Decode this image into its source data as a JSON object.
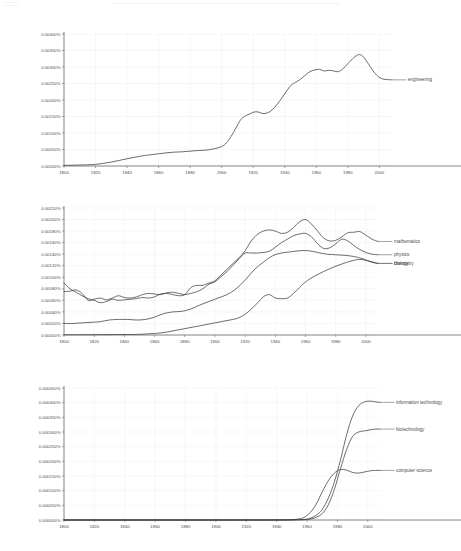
{
  "page": {
    "background_color": "#ffffff",
    "line_color": "#3b3b3b",
    "grid_color": "#e9eef2",
    "axis_color": "#6b6b6b",
    "text_color": "#4a4a4a"
  },
  "chart_data": [
    {
      "id": "chart-engineering",
      "type": "line",
      "title": "",
      "xlabel": "",
      "ylabel": "",
      "grid": true,
      "legend_position": "right-inline",
      "xlim": [
        1800,
        2008
      ],
      "ylim": [
        0,
        0.004
      ],
      "xticks": [
        1800,
        1820,
        1840,
        1860,
        1880,
        1900,
        1920,
        1940,
        1960,
        1980,
        2000
      ],
      "yticks": [
        0,
        0.0005,
        0.001,
        0.0015,
        0.002,
        0.0025,
        0.003,
        0.0035,
        0.004
      ],
      "ytick_labels": [
        "0.00000%",
        "0.00050%",
        "0.00100%",
        "0.00150%",
        "0.00200%",
        "0.00250%",
        "0.00300%",
        "0.00350%",
        "0.00400%"
      ],
      "xtick_labels": [
        "1800",
        "1820",
        "1840",
        "1860",
        "1880",
        "1900",
        "1920",
        "1940",
        "1960",
        "1980",
        "2000"
      ],
      "series": [
        {
          "name": "engineering",
          "label": "engineering",
          "color": "#3b3b3b",
          "x": [
            1800,
            1810,
            1820,
            1830,
            1840,
            1850,
            1855,
            1860,
            1865,
            1870,
            1875,
            1880,
            1885,
            1890,
            1895,
            1900,
            1903,
            1906,
            1909,
            1912,
            1915,
            1918,
            1920,
            1923,
            1926,
            1929,
            1932,
            1935,
            1938,
            1941,
            1944,
            1947,
            1950,
            1953,
            1956,
            1959,
            1962,
            1965,
            1968,
            1971,
            1974,
            1977,
            1980,
            1983,
            1986,
            1988,
            1990,
            1993,
            1996,
            1999,
            2002,
            2005,
            2008
          ],
          "values": [
            2e-05,
            3e-05,
            5e-05,
            0.00012,
            0.00022,
            0.00031,
            0.00034,
            0.00037,
            0.0004,
            0.00042,
            0.00043,
            0.00045,
            0.00047,
            0.00048,
            0.00052,
            0.00059,
            0.0007,
            0.0009,
            0.00115,
            0.0014,
            0.00152,
            0.00158,
            0.00163,
            0.00164,
            0.00159,
            0.00161,
            0.0017,
            0.00186,
            0.00205,
            0.00226,
            0.00245,
            0.00254,
            0.00263,
            0.00275,
            0.00286,
            0.00291,
            0.00293,
            0.00288,
            0.0029,
            0.00288,
            0.00286,
            0.00295,
            0.0031,
            0.00325,
            0.00336,
            0.00337,
            0.0033,
            0.0031,
            0.00288,
            0.00272,
            0.00264,
            0.00262,
            0.00261
          ]
        }
      ]
    },
    {
      "id": "chart-sciences",
      "type": "line",
      "title": "",
      "xlabel": "",
      "ylabel": "",
      "grid": true,
      "legend_position": "right-inline",
      "xlim": [
        1800,
        2008
      ],
      "ylim": [
        0,
        0.0022
      ],
      "xticks": [
        1800,
        1820,
        1840,
        1860,
        1880,
        1900,
        1920,
        1940,
        1960,
        1980,
        2000
      ],
      "yticks": [
        0,
        0.0002,
        0.0004,
        0.0006,
        0.0008,
        0.001,
        0.0012,
        0.0014,
        0.0016,
        0.0018,
        0.002,
        0.0022
      ],
      "ytick_labels": [
        "0.00000%",
        "0.00020%",
        "0.00040%",
        "0.00060%",
        "0.00080%",
        "0.00100%",
        "0.00120%",
        "0.00140%",
        "0.00160%",
        "0.00180%",
        "0.00200%",
        "0.00220%"
      ],
      "xtick_labels": [
        "1800",
        "1820",
        "1840",
        "1860",
        "1880",
        "1900",
        "1920",
        "1940",
        "1960",
        "1980",
        "2000"
      ],
      "series": [
        {
          "name": "mathematics",
          "label": "mathematics",
          "color": "#3b3b3b",
          "x": [
            1800,
            1804,
            1808,
            1812,
            1816,
            1820,
            1824,
            1828,
            1832,
            1836,
            1840,
            1844,
            1848,
            1852,
            1856,
            1860,
            1864,
            1868,
            1872,
            1876,
            1880,
            1884,
            1888,
            1892,
            1896,
            1900,
            1904,
            1908,
            1912,
            1916,
            1920,
            1924,
            1928,
            1932,
            1936,
            1940,
            1944,
            1948,
            1952,
            1956,
            1960,
            1964,
            1968,
            1972,
            1976,
            1980,
            1984,
            1988,
            1992,
            1996,
            2000,
            2004,
            2008
          ],
          "values": [
            0.0009,
            0.0008,
            0.00074,
            0.00068,
            0.00063,
            0.0006,
            0.00056,
            0.00058,
            0.00062,
            0.0006,
            0.00061,
            0.00062,
            0.00063,
            0.00065,
            0.00064,
            0.00066,
            0.00071,
            0.00072,
            0.0007,
            0.00068,
            0.0007,
            0.00082,
            0.00086,
            0.00086,
            0.0009,
            0.00094,
            0.00104,
            0.00114,
            0.00124,
            0.00134,
            0.00146,
            0.00163,
            0.00174,
            0.0018,
            0.00182,
            0.0018,
            0.00176,
            0.00178,
            0.00186,
            0.00196,
            0.002,
            0.00192,
            0.0018,
            0.00168,
            0.00163,
            0.00164,
            0.0017,
            0.00177,
            0.00178,
            0.00179,
            0.00173,
            0.00166,
            0.00162
          ]
        },
        {
          "name": "physics",
          "label": "physics",
          "color": "#3b3b3b",
          "x": [
            1800,
            1804,
            1808,
            1812,
            1816,
            1820,
            1824,
            1828,
            1832,
            1836,
            1840,
            1844,
            1848,
            1852,
            1856,
            1860,
            1864,
            1868,
            1872,
            1876,
            1880,
            1884,
            1888,
            1892,
            1896,
            1900,
            1904,
            1908,
            1912,
            1916,
            1920,
            1924,
            1928,
            1932,
            1936,
            1940,
            1944,
            1948,
            1952,
            1956,
            1960,
            1964,
            1968,
            1972,
            1976,
            1980,
            1984,
            1988,
            1992,
            1996,
            2000,
            2004,
            2008
          ],
          "values": [
            0.00075,
            0.00076,
            0.00078,
            0.00072,
            0.0006,
            0.00062,
            0.00064,
            0.00061,
            0.00064,
            0.00068,
            0.00065,
            0.00064,
            0.00066,
            0.0007,
            0.00072,
            0.00071,
            0.0007,
            0.00073,
            0.00074,
            0.00072,
            0.0007,
            0.00072,
            0.00075,
            0.0008,
            0.00088,
            0.00092,
            0.00101,
            0.0011,
            0.00121,
            0.00132,
            0.00142,
            0.00142,
            0.00142,
            0.00143,
            0.00145,
            0.00152,
            0.0016,
            0.00166,
            0.00172,
            0.00175,
            0.00176,
            0.0017,
            0.00158,
            0.0015,
            0.00151,
            0.00158,
            0.00166,
            0.00163,
            0.00155,
            0.00148,
            0.00143,
            0.0014,
            0.00139
          ]
        },
        {
          "name": "chemistry",
          "label": "chemistry",
          "color": "#3b3b3b",
          "x": [
            1800,
            1806,
            1812,
            1818,
            1824,
            1830,
            1836,
            1842,
            1848,
            1854,
            1860,
            1866,
            1872,
            1878,
            1884,
            1890,
            1896,
            1902,
            1908,
            1914,
            1920,
            1926,
            1932,
            1938,
            1944,
            1950,
            1956,
            1962,
            1968,
            1974,
            1980,
            1986,
            1992,
            1998,
            2004,
            2008
          ],
          "values": [
            0.0002,
            0.0002,
            0.00021,
            0.00022,
            0.00023,
            0.00026,
            0.00027,
            0.00027,
            0.00026,
            0.00027,
            0.00031,
            0.00037,
            0.0004,
            0.00041,
            0.00045,
            0.00052,
            0.00058,
            0.00064,
            0.0007,
            0.0008,
            0.00095,
            0.00113,
            0.00126,
            0.00137,
            0.00142,
            0.00144,
            0.00146,
            0.00146,
            0.00143,
            0.0014,
            0.00139,
            0.00138,
            0.00136,
            0.00132,
            0.00126,
            0.00124
          ]
        },
        {
          "name": "biology",
          "label": "biology",
          "color": "#3b3b3b",
          "x": [
            1800,
            1812,
            1824,
            1836,
            1848,
            1856,
            1862,
            1868,
            1874,
            1880,
            1886,
            1892,
            1898,
            1904,
            1910,
            1916,
            1922,
            1928,
            1932,
            1936,
            1940,
            1944,
            1948,
            1952,
            1956,
            1960,
            1966,
            1972,
            1978,
            1984,
            1990,
            1996,
            2002,
            2008
          ],
          "values": [
            5e-06,
            5e-06,
            6e-06,
            8e-06,
            1e-05,
            2e-05,
            3e-05,
            5e-05,
            8e-05,
            0.00011,
            0.00014,
            0.00017,
            0.0002,
            0.00023,
            0.00026,
            0.0003,
            0.0004,
            0.00055,
            0.00066,
            0.0007,
            0.00064,
            0.00063,
            0.00064,
            0.00072,
            0.00082,
            0.00092,
            0.00102,
            0.0011,
            0.00117,
            0.00123,
            0.00128,
            0.00131,
            0.00128,
            0.00124
          ]
        }
      ]
    },
    {
      "id": "chart-technology",
      "type": "line",
      "title": "",
      "xlabel": "",
      "ylabel": "",
      "grid": true,
      "legend_position": "right-inline",
      "xlim": [
        1800,
        2008
      ],
      "ylim": [
        0,
        0.00045
      ],
      "xticks": [
        1800,
        1820,
        1840,
        1860,
        1880,
        1900,
        1920,
        1940,
        1960,
        1980,
        2000
      ],
      "yticks": [
        0,
        5e-05,
        0.0001,
        0.00015,
        0.0002,
        0.00025,
        0.0003,
        0.00035,
        0.0004,
        0.00045
      ],
      "ytick_labels": [
        "0.000000%",
        "0.000050%",
        "0.000100%",
        "0.000150%",
        "0.000200%",
        "0.000250%",
        "0.000300%",
        "0.000350%",
        "0.000400%",
        "0.000450%"
      ],
      "xtick_labels": [
        "1800",
        "1820",
        "1840",
        "1860",
        "1880",
        "1900",
        "1920",
        "1940",
        "1960",
        "1980",
        "2000"
      ],
      "series": [
        {
          "name": "information technology",
          "label": "information technology",
          "color": "#3b3b3b",
          "x": [
            1800,
            1900,
            1940,
            1950,
            1958,
            1962,
            1966,
            1970,
            1974,
            1978,
            1982,
            1986,
            1990,
            1994,
            1998,
            2002,
            2006,
            2008
          ],
          "values": [
            0.0,
            0.0,
            2e-07,
            5e-07,
            2e-06,
            6e-06,
            1.6e-05,
            3.6e-05,
            7.5e-05,
            0.00013,
            0.000205,
            0.00029,
            0.000355,
            0.00039,
            0.000403,
            0.000405,
            0.000402,
            0.000401
          ]
        },
        {
          "name": "biotechnology",
          "label": "biotechnology",
          "color": "#3b3b3b",
          "x": [
            1800,
            1900,
            1940,
            1950,
            1958,
            1962,
            1966,
            1970,
            1974,
            1978,
            1982,
            1986,
            1990,
            1994,
            1998,
            2002,
            2006,
            2008
          ],
          "values": [
            0.0,
            0.0,
            1e-07,
            2e-07,
            1e-06,
            3e-06,
            9e-06,
            2.2e-05,
            5.2e-05,
            0.000105,
            0.000175,
            0.00024,
            0.000285,
            0.0003,
            0.000304,
            0.000308,
            0.00031,
            0.00031
          ]
        },
        {
          "name": "computer science",
          "label": "computer science",
          "color": "#3b3b3b",
          "x": [
            1800,
            1900,
            1940,
            1948,
            1954,
            1958,
            1962,
            1966,
            1970,
            1974,
            1978,
            1982,
            1986,
            1990,
            1994,
            1998,
            2002,
            2006,
            2008
          ],
          "values": [
            0.0,
            0.0,
            2e-07,
            8e-07,
            3e-06,
            9e-06,
            2.5e-05,
            5.4e-05,
            9.6e-05,
            0.000134,
            0.00016,
            0.000172,
            0.00017,
            0.000162,
            0.00016,
            0.000164,
            0.000168,
            0.000169,
            0.000169
          ]
        }
      ]
    }
  ]
}
